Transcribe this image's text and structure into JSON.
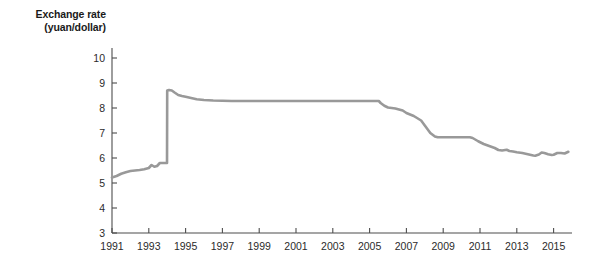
{
  "chart_data": {
    "type": "line",
    "title": "",
    "ylabel_lines": [
      "Exchange rate",
      "(yuan/dollar)"
    ],
    "ylabel": "Exchange rate (yuan/dollar)",
    "xlabel": "",
    "ylim": [
      3,
      10
    ],
    "xlim": [
      1991,
      2016
    ],
    "yticks": [
      3,
      4,
      5,
      6,
      7,
      8,
      9,
      10
    ],
    "ytick_labels": [
      "3",
      "4",
      "5",
      "6",
      "7",
      "8",
      "9",
      "10"
    ],
    "xticks": [
      1991,
      1993,
      1995,
      1997,
      1999,
      2001,
      2003,
      2005,
      2007,
      2009,
      2011,
      2013,
      2015
    ],
    "xtick_labels": [
      "1991",
      "1993",
      "1995",
      "1997",
      "1999",
      "2001",
      "2003",
      "2005",
      "2007",
      "2009",
      "2011",
      "2013",
      "2015"
    ],
    "grid": false,
    "legend": "none",
    "line_color": "#999999",
    "axis_color": "#4d4d4d",
    "text_color": "#2b2b2b",
    "background": "#ffffff",
    "series": [
      {
        "name": "Exchange rate (yuan/dollar)",
        "x": [
          1991.0,
          1991.25,
          1991.5,
          1991.75,
          1992.0,
          1992.25,
          1992.5,
          1992.75,
          1993.0,
          1993.15,
          1993.3,
          1993.45,
          1993.6,
          1993.75,
          1993.9,
          1993.99,
          1994.0,
          1994.1,
          1994.25,
          1994.4,
          1994.6,
          1994.8,
          1995.0,
          1995.3,
          1995.6,
          1996.0,
          1996.5,
          1997.0,
          1997.5,
          1998.0,
          1999.0,
          2000.0,
          2001.0,
          2002.0,
          2003.0,
          2004.0,
          2005.0,
          2005.5,
          2005.6,
          2005.8,
          2006.0,
          2006.4,
          2006.8,
          2007.0,
          2007.4,
          2007.8,
          2008.0,
          2008.3,
          2008.55,
          2008.7,
          2009.0,
          2009.5,
          2010.0,
          2010.45,
          2010.6,
          2010.9,
          2011.2,
          2011.5,
          2011.8,
          2012.0,
          2012.2,
          2012.45,
          2012.6,
          2012.8,
          2013.0,
          2013.3,
          2013.6,
          2013.9,
          2014.0,
          2014.2,
          2014.35,
          2014.5,
          2014.7,
          2014.9,
          2015.0,
          2015.2,
          2015.4,
          2015.6,
          2015.8
        ],
        "values": [
          5.22,
          5.28,
          5.37,
          5.43,
          5.48,
          5.5,
          5.52,
          5.55,
          5.6,
          5.72,
          5.65,
          5.68,
          5.8,
          5.8,
          5.8,
          5.8,
          8.7,
          8.72,
          8.7,
          8.62,
          8.52,
          8.48,
          8.45,
          8.4,
          8.35,
          8.32,
          8.3,
          8.29,
          8.28,
          8.28,
          8.28,
          8.28,
          8.28,
          8.28,
          8.28,
          8.28,
          8.28,
          8.28,
          8.2,
          8.09,
          8.02,
          7.98,
          7.9,
          7.8,
          7.68,
          7.5,
          7.3,
          7.0,
          6.86,
          6.83,
          6.83,
          6.83,
          6.83,
          6.83,
          6.8,
          6.67,
          6.56,
          6.48,
          6.4,
          6.32,
          6.3,
          6.33,
          6.28,
          6.26,
          6.23,
          6.2,
          6.15,
          6.1,
          6.09,
          6.14,
          6.22,
          6.2,
          6.15,
          6.12,
          6.13,
          6.2,
          6.2,
          6.18,
          6.25
        ]
      }
    ],
    "annotations": [
      {
        "label": "1994 devaluation jump",
        "x": 1994.0,
        "y_from": 5.8,
        "y_to": 8.7
      },
      {
        "label": "peg plateau",
        "x_from": 1997.5,
        "x_to": 2005.5,
        "y": 8.28
      },
      {
        "label": "crisis peg plateau",
        "x_from": 2008.7,
        "x_to": 2010.45,
        "y": 6.83
      }
    ]
  }
}
